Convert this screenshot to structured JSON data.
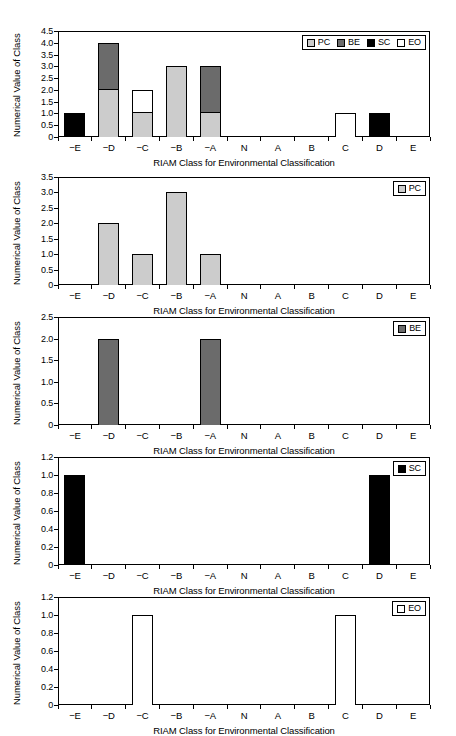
{
  "figure": {
    "categories": [
      "−E",
      "−D",
      "−C",
      "−B",
      "−A",
      "N",
      "A",
      "B",
      "C",
      "D",
      "E"
    ],
    "xlabel": "RIAM Class for Environmental Classification",
    "ylabel": "Numerical Value of Class",
    "colors": {
      "PC": "#cccccc",
      "BE": "#6b6b6b",
      "SC": "#000000",
      "EO": "#ffffff"
    }
  },
  "chart_data": [
    {
      "type": "bar",
      "id": "panel-all",
      "stacked": true,
      "title": "",
      "xlabel": "RIAM Class for Environmental Classification",
      "ylabel": "Numerical Value of Class",
      "categories": [
        "−E",
        "−D",
        "−C",
        "−B",
        "−A",
        "N",
        "A",
        "B",
        "C",
        "D",
        "E"
      ],
      "ylim": [
        0,
        4.5
      ],
      "yticks": [
        "0",
        "0.5",
        "1.0",
        "1.5",
        "2.0",
        "2.5",
        "3.0",
        "3.5",
        "4.0",
        "4.5"
      ],
      "ytick_values": [
        0,
        0.5,
        1.0,
        1.5,
        2.0,
        2.5,
        3.0,
        3.5,
        4.0,
        4.5
      ],
      "grid": false,
      "legend_position": "upper right",
      "series": [
        {
          "name": "PC",
          "values": [
            0,
            2,
            1,
            3,
            1,
            0,
            0,
            0,
            0,
            0,
            0
          ]
        },
        {
          "name": "BE",
          "values": [
            0,
            2,
            0,
            0,
            2,
            0,
            0,
            0,
            0,
            0,
            0
          ]
        },
        {
          "name": "SC",
          "values": [
            1,
            0,
            0,
            0,
            0,
            0,
            0,
            0,
            0,
            1,
            0
          ]
        },
        {
          "name": "EO",
          "values": [
            0,
            0,
            1,
            0,
            0,
            0,
            0,
            0,
            1,
            0,
            0
          ]
        }
      ],
      "legend": [
        "PC",
        "BE",
        "SC",
        "EO"
      ]
    },
    {
      "type": "bar",
      "id": "panel-pc",
      "stacked": false,
      "title": "",
      "xlabel": "RIAM Class for Environmental Classification",
      "ylabel": "Numerical Value of Class",
      "categories": [
        "−E",
        "−D",
        "−C",
        "−B",
        "−A",
        "N",
        "A",
        "B",
        "C",
        "D",
        "E"
      ],
      "ylim": [
        0,
        3.5
      ],
      "yticks": [
        "0",
        "0.5",
        "1.0",
        "1.5",
        "2.0",
        "2.5",
        "3.0",
        "3.5"
      ],
      "ytick_values": [
        0,
        0.5,
        1.0,
        1.5,
        2.0,
        2.5,
        3.0,
        3.5
      ],
      "grid": false,
      "legend_position": "upper right",
      "series": [
        {
          "name": "PC",
          "values": [
            0,
            2,
            1,
            3,
            1,
            0,
            0,
            0,
            0,
            0,
            0
          ]
        }
      ],
      "legend": [
        "PC"
      ]
    },
    {
      "type": "bar",
      "id": "panel-be",
      "stacked": false,
      "title": "",
      "xlabel": "RIAM Class for Environmental Classification",
      "ylabel": "Numerical Value of Class",
      "categories": [
        "−E",
        "−D",
        "−C",
        "−B",
        "−A",
        "N",
        "A",
        "B",
        "C",
        "D",
        "E"
      ],
      "ylim": [
        0,
        2.5
      ],
      "yticks": [
        "0",
        "0.5",
        "1.0",
        "1.5",
        "2.0",
        "2.5"
      ],
      "ytick_values": [
        0,
        0.5,
        1.0,
        1.5,
        2.0,
        2.5
      ],
      "grid": false,
      "legend_position": "upper right",
      "series": [
        {
          "name": "BE",
          "values": [
            0,
            2,
            0,
            0,
            2,
            0,
            0,
            0,
            0,
            0,
            0
          ]
        }
      ],
      "legend": [
        "BE"
      ]
    },
    {
      "type": "bar",
      "id": "panel-sc",
      "stacked": false,
      "title": "",
      "xlabel": "RIAM Class for Environmental Classification",
      "ylabel": "Numerical Value of Class",
      "categories": [
        "−E",
        "−D",
        "−C",
        "−B",
        "−A",
        "N",
        "A",
        "B",
        "C",
        "D",
        "E"
      ],
      "ylim": [
        0,
        1.2
      ],
      "yticks": [
        "0",
        "0.2",
        "0.4",
        "0.6",
        "0.8",
        "1.0",
        "1.2"
      ],
      "ytick_values": [
        0,
        0.2,
        0.4,
        0.6,
        0.8,
        1.0,
        1.2
      ],
      "grid": false,
      "legend_position": "upper right",
      "series": [
        {
          "name": "SC",
          "values": [
            1,
            0,
            0,
            0,
            0,
            0,
            0,
            0,
            0,
            1,
            0
          ]
        }
      ],
      "legend": [
        "SC"
      ]
    },
    {
      "type": "bar",
      "id": "panel-eo",
      "stacked": false,
      "title": "",
      "xlabel": "RIAM Class for Environmental Classification",
      "ylabel": "Numerical Value of Class",
      "categories": [
        "−E",
        "−D",
        "−C",
        "−B",
        "−A",
        "N",
        "A",
        "B",
        "C",
        "D",
        "E"
      ],
      "ylim": [
        0,
        1.2
      ],
      "yticks": [
        "0",
        "0.2",
        "0.4",
        "0.6",
        "0.8",
        "1.0",
        "1.2"
      ],
      "ytick_values": [
        0,
        0.2,
        0.4,
        0.6,
        0.8,
        1.0,
        1.2
      ],
      "grid": false,
      "legend_position": "upper right",
      "series": [
        {
          "name": "EO",
          "values": [
            0,
            0,
            1,
            0,
            0,
            0,
            0,
            0,
            1,
            0,
            0
          ]
        }
      ],
      "legend": [
        "EO"
      ]
    }
  ]
}
